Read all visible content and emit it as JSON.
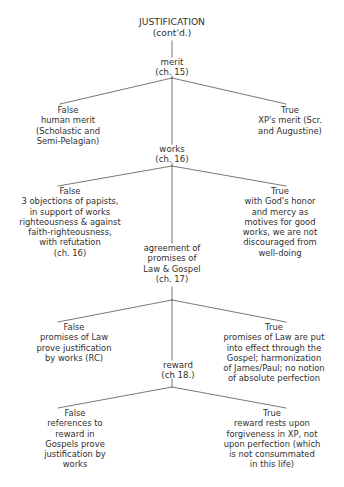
{
  "diagram": {
    "type": "tree",
    "title": "JUSTIFICATION (cont'd.)",
    "stroke_color": "#555555",
    "text_color": "#2f2f2f",
    "background": "#ffffff",
    "nodes": {
      "title": "JUSTIFICATION\n(cont'd.)",
      "merit": "merit\n(ch. 15)",
      "merit_false": "False\nhuman merit\n(Scholastic and\nSemi-Pelagian)",
      "merit_true": "True\nXP's merit (Scr.\nand Augustine)",
      "works": "works\n(ch. 16)",
      "works_false": "False\n3 objections of papists,\nin support of works\nrighteousness & against\nfaith-righteousness,\nwith refutation\n(ch. 16)",
      "works_true": "True\nwith God's honor\nand mercy as\nmotives for good\nworks, we are not\ndiscouraged from\nwell-doing",
      "agreement": "agreement of\npromises of\nLaw & Gospel\n(ch. 17)",
      "agreement_false": "False\npromises of Law\nprove justification\nby works (RC)",
      "agreement_true": "True\npromises of Law are put\ninto effect through the\nGospel; harmonization\nof James/Paul; no notion\nof absolute perfection",
      "reward": "reward\n(ch 18.)",
      "reward_false": "False\nreferences to\nreward in\nGospels prove\njustification by\nworks",
      "reward_true": "True\nreward rests upon\nforgiveness in XP, not\nupon perfection (which\nis not consummated\nin this life)"
    },
    "branch_labels": [
      "False",
      "True"
    ],
    "chapters": [
      "ch. 15",
      "ch. 16",
      "ch. 17",
      "ch 18."
    ]
  }
}
